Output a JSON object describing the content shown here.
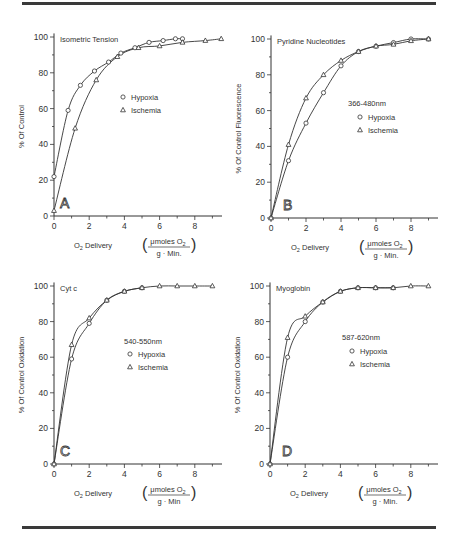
{
  "figure": {
    "x_label_main": "O",
    "x_label_sub": "2",
    "x_label_rest": " Delivery",
    "unit_numerator": "μmoles O",
    "unit_numerator_sub": "2"
  },
  "chart_data": [
    {
      "type": "scatter",
      "panel": "A",
      "title": "Isometric Tension",
      "xlabel": "O2 Delivery (μmoles O2 / g · Min.)",
      "ylabel": "% Of Control",
      "unit_denominator": "g · Min.",
      "legend_header": "",
      "xlim": [
        0,
        9.5
      ],
      "ylim": [
        0,
        100
      ],
      "xticks": [
        0,
        2,
        4,
        6,
        8
      ],
      "yticks": [
        0,
        20,
        40,
        60,
        80,
        100
      ],
      "series": [
        {
          "name": "Hypoxia",
          "marker": "circle",
          "x": [
            0,
            0.8,
            1.5,
            2.3,
            3.1,
            3.8,
            4.6,
            5.4,
            6.2,
            6.9,
            7.3
          ],
          "y": [
            22,
            59,
            73,
            81,
            86,
            91,
            94,
            97,
            98,
            99,
            99
          ]
        },
        {
          "name": "Ischemia",
          "marker": "triangle",
          "x": [
            0,
            1.2,
            2.4,
            3.6,
            4.8,
            6.0,
            7.3,
            8.6,
            9.5
          ],
          "y": [
            3,
            49,
            76,
            89,
            94,
            95,
            97,
            98,
            99
          ]
        }
      ]
    },
    {
      "type": "scatter",
      "panel": "B",
      "title": "Pyridine Nucleotides",
      "xlabel": "O2 Delivery (μmoles O2 / g · Min.)",
      "ylabel": "% Of Control Fluorescence",
      "unit_denominator": "g · Min.",
      "legend_header": "366-480nm",
      "xlim": [
        0,
        9.5
      ],
      "ylim": [
        0,
        100
      ],
      "xticks": [
        0,
        2,
        4,
        6,
        8
      ],
      "yticks": [
        0,
        20,
        40,
        60,
        80,
        100
      ],
      "series": [
        {
          "name": "Hypoxia",
          "marker": "circle",
          "x": [
            0,
            1,
            2,
            3,
            4,
            5,
            6,
            7,
            8,
            9
          ],
          "y": [
            0,
            32,
            53,
            70,
            85,
            93,
            96,
            98,
            100,
            100
          ]
        },
        {
          "name": "Ischemia",
          "marker": "triangle",
          "x": [
            0,
            1,
            2,
            3,
            4,
            5,
            6,
            7,
            8,
            9
          ],
          "y": [
            0,
            41,
            67,
            80,
            88,
            93,
            96,
            97,
            99,
            100
          ]
        }
      ]
    },
    {
      "type": "scatter",
      "panel": "C",
      "title": "Cyt c",
      "xlabel": "O2 Delivery (μmoles O2 / g · Min)",
      "ylabel": "% Of Control  Oxidation",
      "unit_denominator": "g · Min",
      "legend_header": "540-550nm",
      "xlim": [
        0,
        9.5
      ],
      "ylim": [
        0,
        100
      ],
      "xticks": [
        0,
        2,
        4,
        6,
        8
      ],
      "yticks": [
        0,
        20,
        40,
        60,
        80,
        100
      ],
      "series": [
        {
          "name": "Hypoxia",
          "marker": "circle",
          "x": [
            0,
            1,
            2,
            3,
            4,
            5
          ],
          "y": [
            0,
            59,
            79,
            92,
            97,
            99
          ]
        },
        {
          "name": "Ischemia",
          "marker": "triangle",
          "x": [
            0,
            1,
            2,
            3,
            4,
            5,
            6,
            7,
            8,
            9
          ],
          "y": [
            0,
            67,
            82,
            92,
            97,
            99,
            100,
            100,
            100,
            100
          ]
        }
      ]
    },
    {
      "type": "scatter",
      "panel": "D",
      "title": "Myoglobin",
      "xlabel": "O2 Delivery (μmoles O2 / g · Min.)",
      "ylabel": "% Of Control  Oxidation",
      "unit_denominator": "g · Min.",
      "legend_header": "587-620nm",
      "xlim": [
        0,
        9.5
      ],
      "ylim": [
        0,
        100
      ],
      "xticks": [
        0,
        2,
        4,
        6,
        8
      ],
      "yticks": [
        0,
        20,
        40,
        60,
        80,
        100
      ],
      "series": [
        {
          "name": "Hypoxia",
          "marker": "circle",
          "x": [
            0,
            1,
            2,
            3,
            4,
            5,
            6,
            7
          ],
          "y": [
            0,
            60,
            80,
            91,
            97,
            99,
            99,
            99
          ]
        },
        {
          "name": "Ischemia",
          "marker": "triangle",
          "x": [
            0,
            1,
            2,
            3,
            4,
            5,
            6,
            7,
            8,
            9
          ],
          "y": [
            0,
            71,
            83,
            91,
            97,
            99,
            99,
            99,
            100,
            100
          ]
        }
      ]
    }
  ]
}
